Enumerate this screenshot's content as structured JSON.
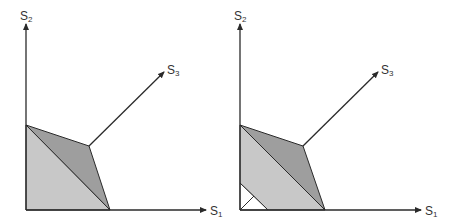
{
  "diagrams": [
    {
      "id": "left",
      "axes": {
        "x_label": "S",
        "x_sub": "1",
        "y_label": "S",
        "y_sub": "2",
        "diag_label": "S",
        "diag_sub": "3"
      },
      "regions": [
        "light-triangle",
        "dark-quadrilateral"
      ]
    },
    {
      "id": "right",
      "axes": {
        "x_label": "S",
        "x_sub": "1",
        "y_label": "S",
        "y_sub": "2",
        "diag_label": "S",
        "diag_sub": "3"
      },
      "regions": [
        "light-band",
        "dark-quadrilateral",
        "white-corner-triangle"
      ]
    }
  ],
  "colors": {
    "light_fill": "#c8c8c8",
    "dark_fill": "#9e9e9e",
    "line": "#2a2a2a"
  }
}
